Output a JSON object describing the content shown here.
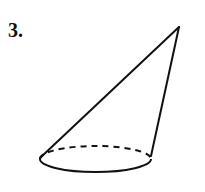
{
  "problem": {
    "number_label": "3."
  },
  "figure": {
    "type": "oblique-cone",
    "apex": [
      179,
      27
    ],
    "base_left": [
      40,
      158
    ],
    "base_right": [
      151,
      156
    ],
    "base_ellipse": {
      "cx": 95.5,
      "cy": 159,
      "rx": 55.5,
      "ry": 13
    },
    "colors": {
      "stroke": "#111111",
      "background": "#ffffff"
    }
  }
}
